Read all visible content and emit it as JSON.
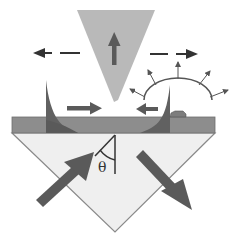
{
  "diagram": {
    "type": "schematic",
    "labels": {
      "angle": "θ"
    },
    "colors": {
      "background": "#ffffff",
      "film": "#8d8d8d",
      "film_edge": "#6f6f6f",
      "prism_fill": "#efefef",
      "prism_edge": "#8a8a8a",
      "tip": "#b9b9b9",
      "dark_arrow": "#5a5a5a",
      "cusp": "#616161",
      "line": "#333333"
    },
    "elements": [
      {
        "name": "probe-tip",
        "shape": "inverted-triangle"
      },
      {
        "name": "tip-up-arrow",
        "direction": "up"
      },
      {
        "name": "dashed-arrow-left",
        "direction": "left"
      },
      {
        "name": "dashed-arrow-right",
        "direction": "right"
      },
      {
        "name": "film-layer",
        "shape": "bar"
      },
      {
        "name": "evanescent-cusp-left"
      },
      {
        "name": "evanescent-cusp-right"
      },
      {
        "name": "surface-wave-arrow-right",
        "direction": "right"
      },
      {
        "name": "surface-wave-arrow-left",
        "direction": "left"
      },
      {
        "name": "scattering-arc",
        "radiating_arrows": 5
      },
      {
        "name": "surface-particle"
      },
      {
        "name": "prism",
        "shape": "triangle"
      },
      {
        "name": "incident-beam-arrow",
        "direction": "up-right"
      },
      {
        "name": "reflected-beam-arrow",
        "direction": "down-right"
      },
      {
        "name": "angle-marker",
        "label": "θ"
      }
    ]
  }
}
